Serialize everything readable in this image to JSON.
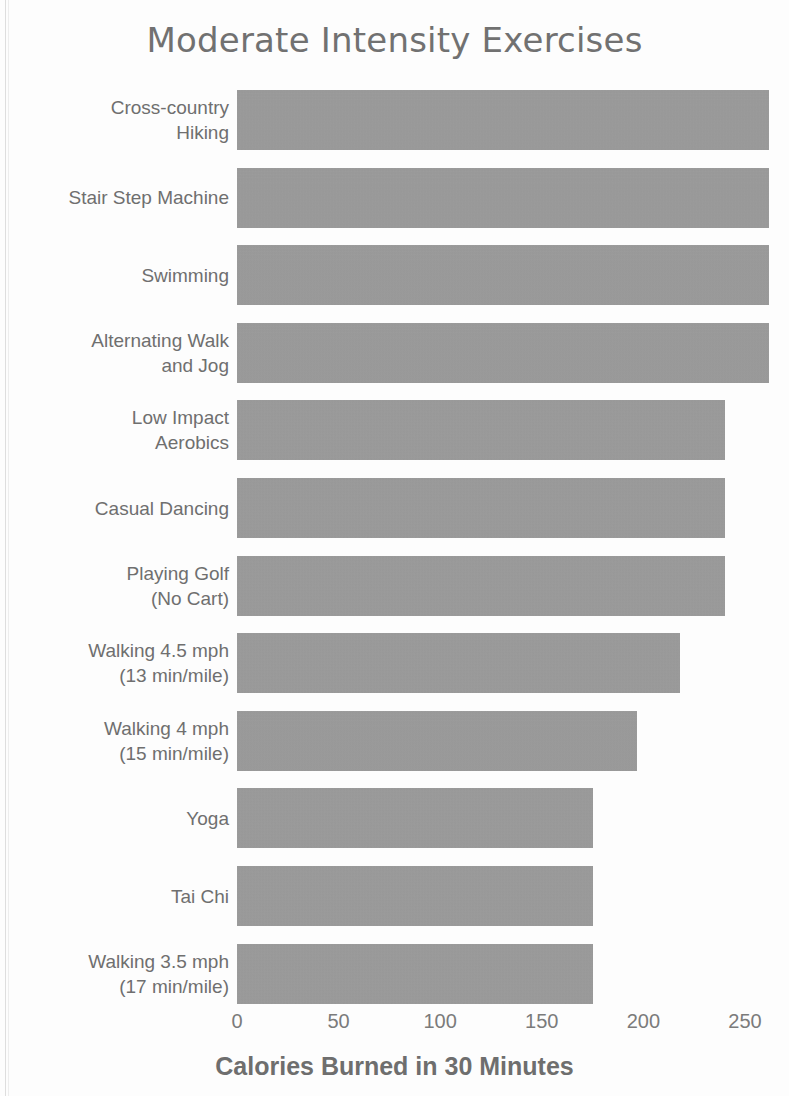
{
  "chart_data": {
    "type": "bar",
    "orientation": "horizontal",
    "title": "Moderate Intensity Exercises",
    "xlabel": "Calories Burned in 30 Minutes",
    "ylabel": "",
    "xlim": [
      0,
      270
    ],
    "xticks": [
      0,
      50,
      100,
      150,
      200,
      250
    ],
    "xtick_labels": [
      "0",
      "50",
      "100",
      "150",
      "200",
      "250"
    ],
    "grid": false,
    "legend": null,
    "bar_color": "#9b9b9b",
    "categories": [
      "Cross-country\nHiking",
      "Stair Step Machine",
      "Swimming",
      "Alternating Walk\nand Jog",
      "Low Impact\nAerobics",
      "Casual Dancing",
      "Playing Golf\n(No Cart)",
      "Walking 4.5 mph\n(13 min/mile)",
      "Walking 4 mph\n(15 min/mile)",
      "Yoga",
      "Tai Chi",
      "Walking 3.5 mph\n(17 min/mile)"
    ],
    "values": [
      262,
      262,
      262,
      262,
      240,
      240,
      240,
      218,
      197,
      175,
      175,
      175
    ]
  },
  "page": {
    "background_color": "#fdfdfd",
    "text_color": "#6f6f6f"
  }
}
